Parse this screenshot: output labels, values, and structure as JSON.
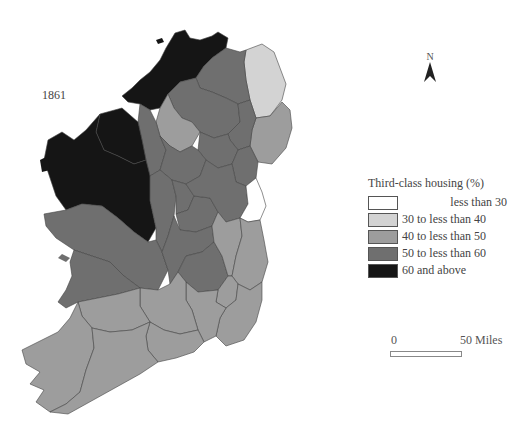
{
  "map": {
    "year": "1861",
    "north_label": "N",
    "colors": {
      "lt30": "#ffffff",
      "30to40": "#d3d3d3",
      "40to50": "#9d9d9d",
      "50to60": "#6f6f6f",
      "60plus": "#151515"
    },
    "regions": [
      {
        "name": "Donegal",
        "category": "60plus"
      },
      {
        "name": "Mayo",
        "category": "60plus"
      },
      {
        "name": "Sligo",
        "category": "60plus"
      },
      {
        "name": "Antrim",
        "category": "30to40"
      },
      {
        "name": "Down",
        "category": "40to50"
      },
      {
        "name": "Fermanagh",
        "category": "40to50"
      },
      {
        "name": "Derry",
        "category": "50to60"
      },
      {
        "name": "Tyrone",
        "category": "50to60"
      },
      {
        "name": "Armagh",
        "category": "50to60"
      },
      {
        "name": "Monaghan",
        "category": "50to60"
      },
      {
        "name": "Cavan",
        "category": "50to60"
      },
      {
        "name": "Leitrim",
        "category": "50to60"
      },
      {
        "name": "Roscommon",
        "category": "50to60"
      },
      {
        "name": "Longford",
        "category": "50to60"
      },
      {
        "name": "Westmeath",
        "category": "50to60"
      },
      {
        "name": "Meath",
        "category": "50to60"
      },
      {
        "name": "Louth",
        "category": "50to60"
      },
      {
        "name": "Galway",
        "category": "50to60"
      },
      {
        "name": "Clare",
        "category": "50to60"
      },
      {
        "name": "Offaly",
        "category": "50to60"
      },
      {
        "name": "Laois",
        "category": "50to60"
      },
      {
        "name": "Dublin",
        "category": "lt30"
      },
      {
        "name": "Kildare",
        "category": "40to50"
      },
      {
        "name": "Wicklow",
        "category": "40to50"
      },
      {
        "name": "Wexford",
        "category": "40to50"
      },
      {
        "name": "Carlow",
        "category": "40to50"
      },
      {
        "name": "Kilkenny",
        "category": "40to50"
      },
      {
        "name": "Tipperary",
        "category": "40to50"
      },
      {
        "name": "Limerick",
        "category": "40to50"
      },
      {
        "name": "Kerry",
        "category": "40to50"
      },
      {
        "name": "Cork",
        "category": "40to50"
      },
      {
        "name": "Waterford",
        "category": "40to50"
      }
    ]
  },
  "legend": {
    "title": "Third-class housing (%)",
    "items": [
      {
        "label": "less than 30",
        "color": "#ffffff"
      },
      {
        "label": "30 to less than 40",
        "color": "#d3d3d3"
      },
      {
        "label": "40 to less than 50",
        "color": "#9d9d9d"
      },
      {
        "label": "50 to less than 60",
        "color": "#6f6f6f"
      },
      {
        "label": "60 and above",
        "color": "#151515"
      }
    ]
  },
  "scale": {
    "start_label": "0",
    "end_label": "50 Miles"
  }
}
